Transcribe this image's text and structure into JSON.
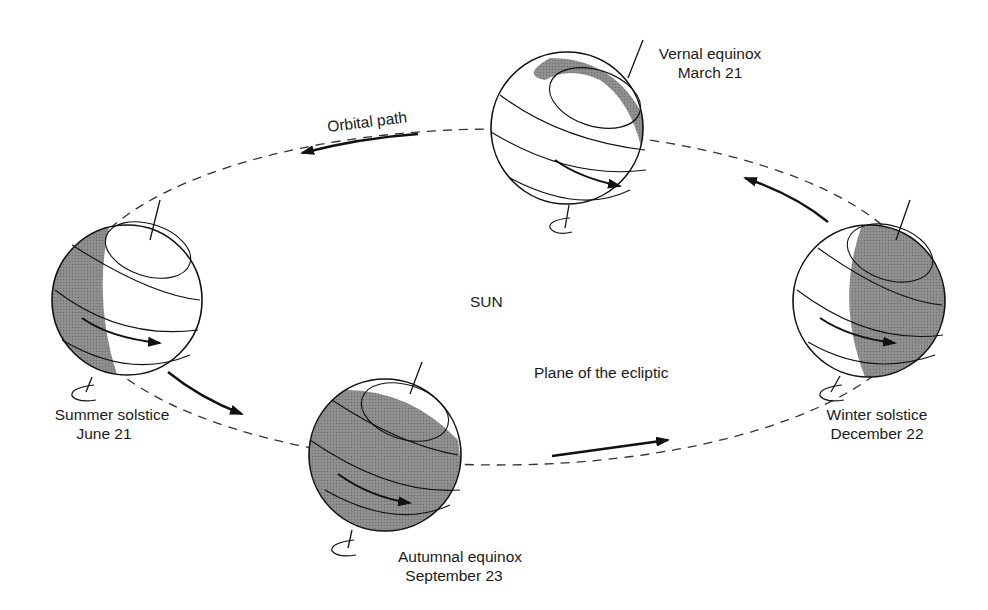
{
  "diagram": {
    "center_label": "SUN",
    "orbit_label": "Orbital path",
    "plane_label": "Plane of the ecliptic",
    "positions": [
      {
        "id": "vernal",
        "name": "Vernal equinox",
        "date": "March 21",
        "shading": "thin crescent on upper-right rim"
      },
      {
        "id": "summer",
        "name": "Summer solstice",
        "date": "June 21",
        "shading": "left crescent"
      },
      {
        "id": "autumnal",
        "name": "Autumnal equinox",
        "date": "September 23",
        "shading": "nearly fully shaded"
      },
      {
        "id": "winter",
        "name": "Winter solstice",
        "date": "December 22",
        "shading": "right two-thirds shaded"
      }
    ],
    "colors": {
      "ink": "#111111",
      "shade": "#8a8a8a",
      "background": "#ffffff"
    }
  }
}
